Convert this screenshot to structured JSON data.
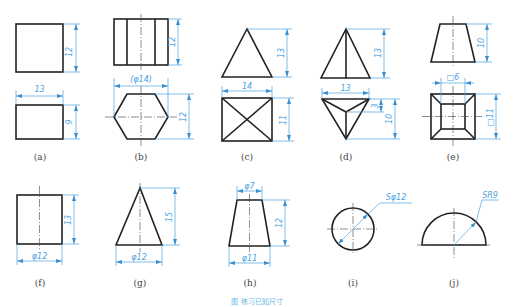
{
  "figure": {
    "caption": "图 练习已知尺寸",
    "colors": {
      "outline": "#222222",
      "dimension": "#4aa3df",
      "label": "#444444"
    },
    "panels": [
      {
        "id": "a",
        "label": "(a)",
        "dims": {
          "top_h": "12",
          "bottom_w": "13",
          "bottom_h": "9"
        }
      },
      {
        "id": "b",
        "label": "(b)",
        "dims": {
          "top_h": "12",
          "bottom_w": "(φ14)",
          "bottom_h": "12"
        }
      },
      {
        "id": "c",
        "label": "(c)",
        "dims": {
          "top_h": "13",
          "bottom_w": "14",
          "bottom_h": "11"
        }
      },
      {
        "id": "d",
        "label": "(d)",
        "dims": {
          "top_h": "13",
          "bottom_w": "13",
          "bottom_small": "3",
          "bottom_h": "10"
        }
      },
      {
        "id": "e",
        "label": "(e)",
        "dims": {
          "top_h": "10",
          "bottom_w": "□6",
          "bottom_h": "□11"
        }
      },
      {
        "id": "f",
        "label": "(f)",
        "dims": {
          "h": "13",
          "w": "φ12"
        }
      },
      {
        "id": "g",
        "label": "(g)",
        "dims": {
          "h": "15",
          "w": "φ12"
        }
      },
      {
        "id": "h",
        "label": "(h)",
        "dims": {
          "top_w": "φ7",
          "h": "12",
          "w": "φ11"
        }
      },
      {
        "id": "i",
        "label": "(i)",
        "dims": {
          "d": "Sφ12"
        }
      },
      {
        "id": "j",
        "label": "(j)",
        "dims": {
          "r": "SR9"
        }
      }
    ]
  }
}
